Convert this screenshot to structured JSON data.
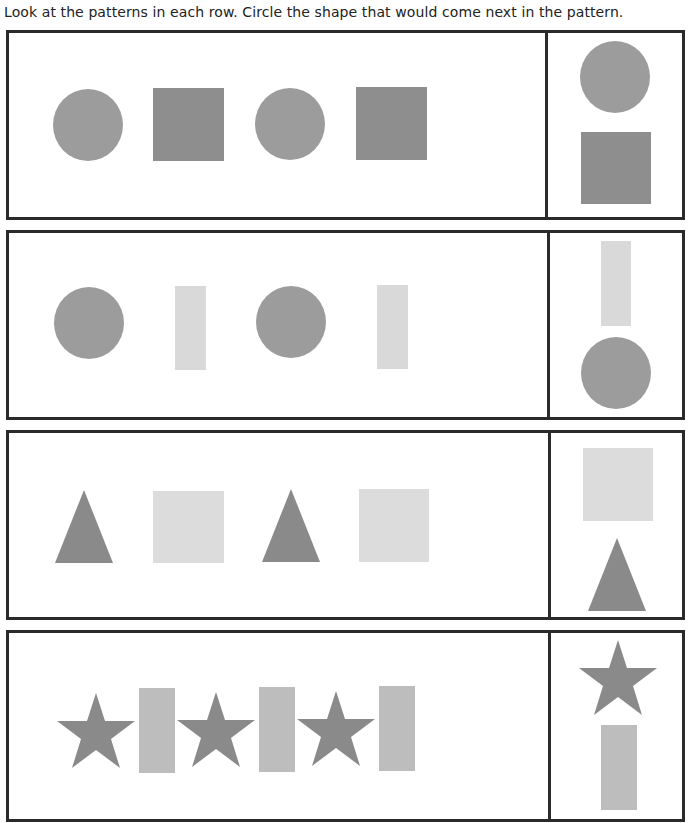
{
  "instructions": "Look at the patterns in each row. Circle the shape that would come next in the pattern.",
  "colors": {
    "medium_gray": "#9a9a9a",
    "dark_gray": "#8c8c8c",
    "light_gray": "#d9d9d9",
    "bar_gray": "#bdbdbd",
    "border": "#2a2a2a"
  },
  "rows": [
    {
      "pattern": [
        "circle",
        "square",
        "circle",
        "square"
      ],
      "choices": [
        "circle",
        "square"
      ]
    },
    {
      "pattern": [
        "circle",
        "rectangle",
        "circle",
        "rectangle"
      ],
      "choices": [
        "rectangle",
        "circle"
      ]
    },
    {
      "pattern": [
        "triangle",
        "square",
        "triangle",
        "square"
      ],
      "choices": [
        "square",
        "triangle"
      ]
    },
    {
      "pattern": [
        "star",
        "rectangle",
        "star",
        "rectangle",
        "star",
        "rectangle"
      ],
      "choices": [
        "star",
        "rectangle"
      ]
    }
  ]
}
